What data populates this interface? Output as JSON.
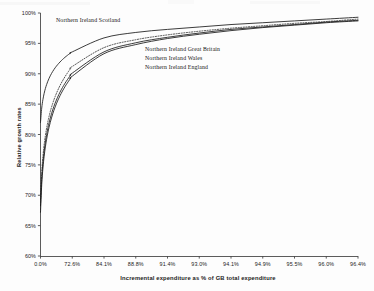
{
  "figure": {
    "background_color": "#fdfdfd",
    "ink_color": "#1a1a1a",
    "axis_color": "#4a4a4a"
  },
  "chart_data": {
    "type": "line",
    "title": "",
    "subtitle": "",
    "xlabel": "Incremental expenditure as % of GB total expenditure",
    "ylabel": "Relative growth rates",
    "grid": false,
    "legend_position": "inline-annotations",
    "ylim": [
      60,
      100
    ],
    "ytick_labels": [
      "60%",
      "65%",
      "70%",
      "75%",
      "80%",
      "85%",
      "90%",
      "95%",
      "100%"
    ],
    "ytick_values": [
      60,
      65,
      70,
      75,
      80,
      85,
      90,
      95,
      100
    ],
    "xtick_labels": [
      "0.0%",
      "72.6%",
      "84.1%",
      "88.8%",
      "91.4%",
      "93.0%",
      "94.1%",
      "94.9%",
      "95.5%",
      "96.0%",
      "96.4%"
    ],
    "xtick_values": [
      0.0,
      72.6,
      84.1,
      88.8,
      91.4,
      93.0,
      94.1,
      94.9,
      95.5,
      96.0,
      96.4
    ],
    "x_axis_note": "Tick labels are rank-ordered cumulative percentages and are plotted at equal horizontal spacing.",
    "x_positions_normalized": [
      0,
      0.1,
      0.2,
      0.3,
      0.4,
      0.5,
      0.6,
      0.7,
      0.8,
      0.9,
      1.0
    ],
    "series": [
      {
        "name": "Northern Ireland Scotland",
        "style": "solid",
        "annotation": "Northern Ireland Scotland",
        "values": [
          82.0,
          93.6,
          95.9,
          96.8,
          97.3,
          97.7,
          98.1,
          98.4,
          98.7,
          99.0,
          99.3
        ]
      },
      {
        "name": "Northern Ireland Great Britain",
        "style": "dotted",
        "annotation": "Northern Ireland Great Britain",
        "values": [
          69.3,
          91.2,
          94.3,
          95.6,
          96.4,
          97.0,
          97.5,
          97.9,
          98.3,
          98.6,
          99.0
        ]
      },
      {
        "name": "Northern Ireland Wales",
        "style": "solid",
        "annotation": "Northern Ireland Wales",
        "values": [
          68.3,
          90.1,
          93.6,
          95.1,
          96.0,
          96.7,
          97.3,
          97.7,
          98.1,
          98.5,
          98.8
        ]
      },
      {
        "name": "Northern Ireland England",
        "style": "solid",
        "annotation": "Northern Ireland England",
        "values": [
          67.2,
          89.6,
          93.3,
          94.8,
          95.8,
          96.5,
          97.1,
          97.6,
          98.0,
          98.4,
          98.7
        ]
      }
    ]
  }
}
